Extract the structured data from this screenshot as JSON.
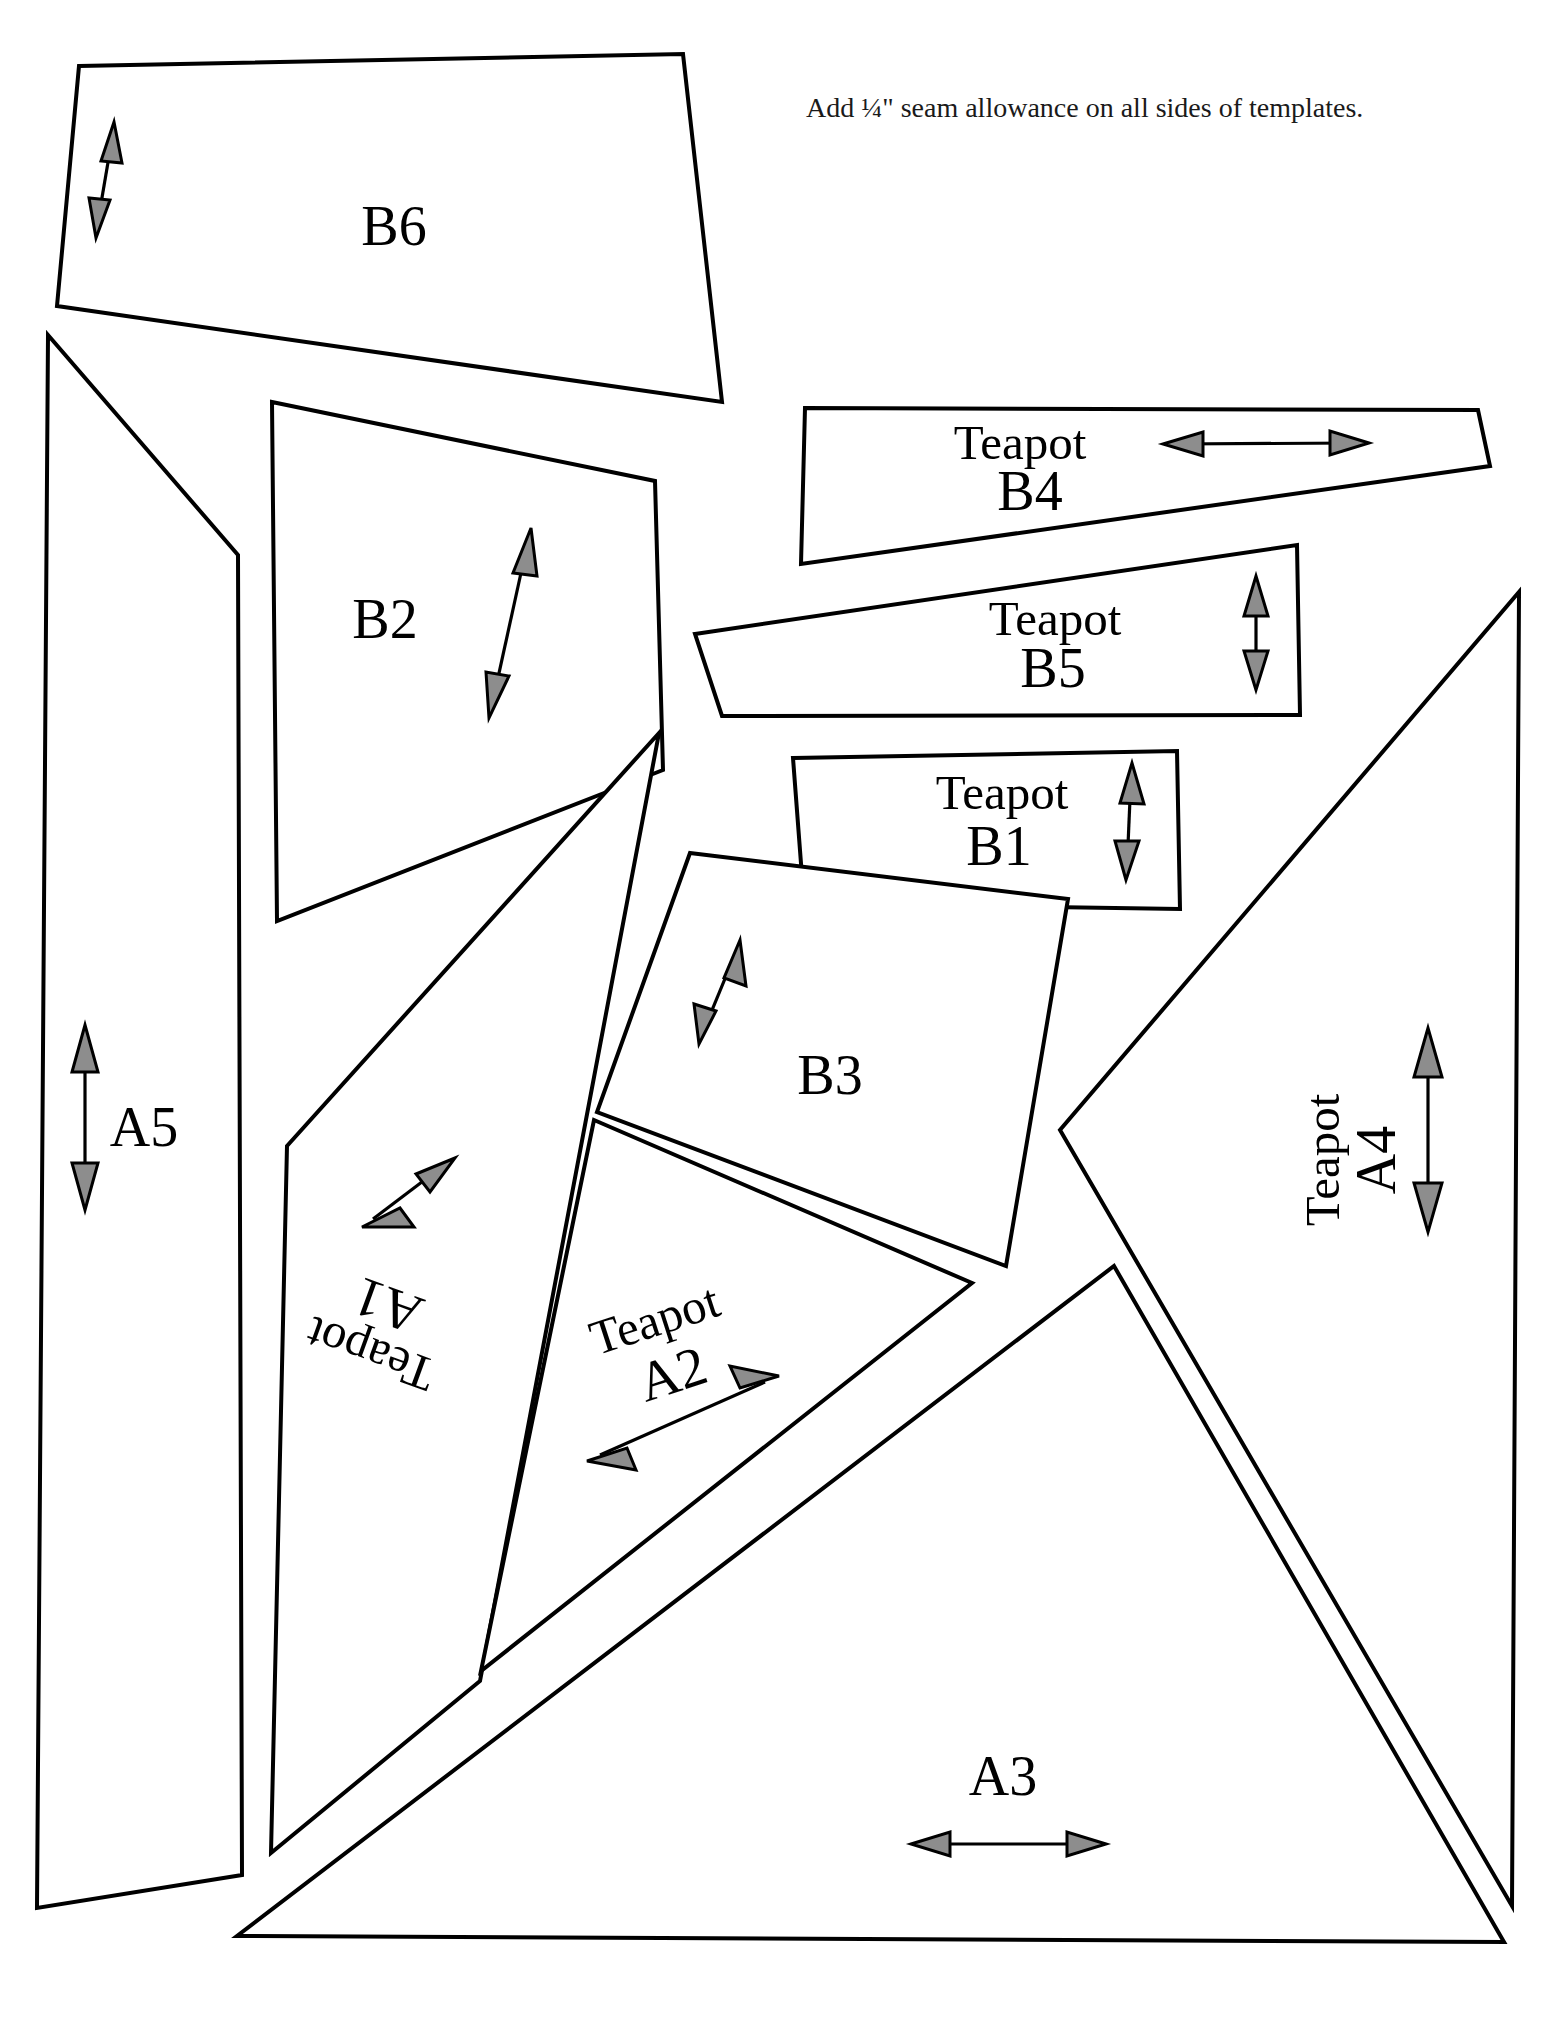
{
  "document": {
    "type": "quilt-template-sheet",
    "instruction": "Add ¼\" seam allowance on all sides of templates.",
    "background_color": "#ffffff",
    "line_color": "#000000",
    "arrow_fill_color": "#8d8d8d"
  },
  "pieces": [
    {
      "id": "B6",
      "label": "B6",
      "prefix": "",
      "label_lines": [
        "B6"
      ],
      "grain_arrow": "double-headed",
      "grain_orientation": "near-vertical"
    },
    {
      "id": "B2",
      "label": "B2",
      "prefix": "",
      "label_lines": [
        "B2"
      ],
      "grain_arrow": "double-headed",
      "grain_orientation": "near-vertical"
    },
    {
      "id": "B4",
      "label": "Teapot B4",
      "prefix": "Teapot",
      "label_lines": [
        "Teapot",
        "B4"
      ],
      "grain_arrow": "double-headed",
      "grain_orientation": "horizontal"
    },
    {
      "id": "B5",
      "label": "Teapot B5",
      "prefix": "Teapot",
      "label_lines": [
        "Teapot",
        "B5"
      ],
      "grain_arrow": "double-headed",
      "grain_orientation": "vertical"
    },
    {
      "id": "B1",
      "label": "Teapot B1",
      "prefix": "Teapot",
      "label_lines": [
        "Teapot",
        "B1"
      ],
      "grain_arrow": "double-headed",
      "grain_orientation": "vertical"
    },
    {
      "id": "B3",
      "label": "B3",
      "prefix": "",
      "label_lines": [
        "B3"
      ],
      "grain_arrow": "double-headed",
      "grain_orientation": "near-vertical"
    },
    {
      "id": "A5",
      "label": "A5",
      "prefix": "",
      "label_lines": [
        "A5"
      ],
      "grain_arrow": "double-headed",
      "grain_orientation": "vertical"
    },
    {
      "id": "A1",
      "label": "Teapot A1",
      "prefix": "Teapot",
      "label_lines": [
        "Teapot",
        "A1"
      ],
      "grain_arrow": "double-headed",
      "grain_orientation": "diagonal",
      "label_rotation_deg": 200
    },
    {
      "id": "A2",
      "label": "Teapot A2",
      "prefix": "Teapot",
      "label_lines": [
        "Teapot",
        "A2"
      ],
      "grain_arrow": "double-headed",
      "grain_orientation": "diagonal",
      "label_rotation_deg": -18
    },
    {
      "id": "A3",
      "label": "A3",
      "prefix": "",
      "label_lines": [
        "A3"
      ],
      "grain_arrow": "double-headed",
      "grain_orientation": "horizontal"
    },
    {
      "id": "A4",
      "label": "Teapot A4",
      "prefix": "Teapot",
      "label_lines": [
        "Teapot",
        "A4"
      ],
      "grain_arrow": "double-headed",
      "grain_orientation": "vertical",
      "label_rotation_deg": -90
    }
  ],
  "labels": {
    "b6": "B6",
    "b2": "B2",
    "b3": "B3",
    "a5": "A5",
    "a3": "A3",
    "teapot": "Teapot",
    "b4_num": "B4",
    "b5_num": "B5",
    "b1_num": "B1",
    "a1_num": "A1",
    "a2_num": "A2",
    "a4_num": "A4"
  }
}
